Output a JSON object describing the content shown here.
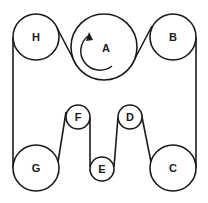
{
  "diagram": {
    "type": "belt-and-pulley",
    "colors": {
      "stroke": "#1a1a1a",
      "background": "#ffffff"
    },
    "pulleys": [
      {
        "id": "A",
        "label": "A",
        "cx": 104,
        "cy": 47,
        "r": 33,
        "role": "driver"
      },
      {
        "id": "B",
        "label": "B",
        "cx": 173,
        "cy": 37,
        "r": 23
      },
      {
        "id": "C",
        "label": "C",
        "cx": 173,
        "cy": 168,
        "r": 23
      },
      {
        "id": "D",
        "label": "D",
        "cx": 130,
        "cy": 117,
        "r": 12
      },
      {
        "id": "E",
        "label": "E",
        "cx": 102,
        "cy": 169,
        "r": 12
      },
      {
        "id": "F",
        "label": "F",
        "cx": 78,
        "cy": 117,
        "r": 12
      },
      {
        "id": "G",
        "label": "G",
        "cx": 36,
        "cy": 168,
        "r": 23
      },
      {
        "id": "H",
        "label": "H",
        "cx": 36,
        "cy": 37,
        "r": 23
      }
    ],
    "rotation_arrow": {
      "pulley": "A",
      "direction": "clockwise"
    }
  }
}
